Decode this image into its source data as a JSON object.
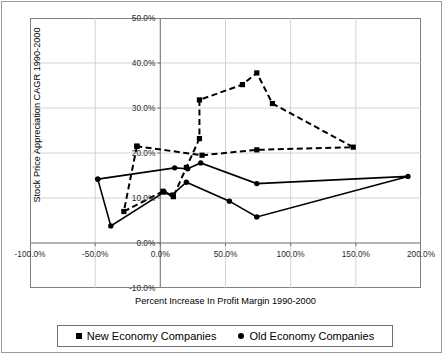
{
  "chart_data": {
    "type": "scatter",
    "title": "",
    "xlabel": "Percent Increase In Profit Margin 1990-2000",
    "ylabel": "Stock Price Appreciation CAGR 1990-2000",
    "xlim": [
      -100,
      200
    ],
    "ylim": [
      -10,
      50
    ],
    "xticks": [
      -100,
      -50,
      0,
      50,
      100,
      150,
      200
    ],
    "yticks": [
      -10,
      0,
      10,
      20,
      30,
      40,
      50
    ],
    "xtick_labels": [
      "-100.0%",
      "-50.0%",
      "0.0%",
      "50.0%",
      "100.0%",
      "150.0%",
      "200.0%"
    ],
    "ytick_labels": [
      "-10.0%",
      "0.0%",
      "10.0%",
      "20.0%",
      "30.0%",
      "40.0%",
      "50.0%"
    ],
    "grid": true,
    "legend_position": "bottom",
    "series": [
      {
        "name": "New Economy Companies",
        "marker": "square",
        "linestyle": "dashed",
        "color": "#000000",
        "points": [
          [
            -18.0,
            21.5
          ],
          [
            -28.0,
            7.0
          ],
          [
            2.0,
            11.5
          ],
          [
            10.0,
            10.3
          ],
          [
            20.0,
            16.8
          ],
          [
            30.0,
            23.2
          ],
          [
            30.0,
            31.8
          ],
          [
            63.0,
            35.2
          ],
          [
            74.0,
            37.8
          ],
          [
            86.0,
            31.0
          ],
          [
            148.0,
            21.3
          ],
          [
            74.0,
            20.7
          ],
          [
            32.0,
            19.5
          ],
          [
            -18.0,
            21.5
          ]
        ]
      },
      {
        "name": "Old Economy Companies",
        "marker": "circle",
        "linestyle": "solid",
        "color": "#000000",
        "points": [
          [
            -48.0,
            14.2
          ],
          [
            -38.0,
            3.8
          ],
          [
            3.0,
            11.3
          ],
          [
            9.0,
            10.7
          ],
          [
            20.0,
            13.5
          ],
          [
            53.0,
            9.3
          ],
          [
            74.0,
            5.8
          ],
          [
            190.0,
            14.8
          ],
          [
            74.0,
            13.2
          ],
          [
            31.0,
            17.8
          ],
          [
            21.0,
            16.5
          ],
          [
            11.0,
            16.7
          ],
          [
            -48.0,
            14.2
          ]
        ]
      }
    ]
  },
  "legend": {
    "entries": [
      {
        "label": "New Economy Companies",
        "marker": "square-marker-icon"
      },
      {
        "label": "Old Economy Companies",
        "marker": "circle-marker-icon"
      }
    ]
  }
}
